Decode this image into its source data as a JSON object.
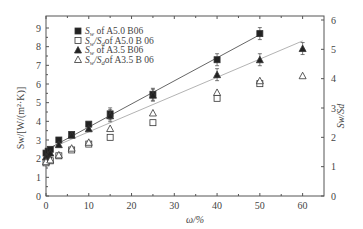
{
  "chart_data": {
    "type": "scatter",
    "title": "",
    "xlabel": "ω/%",
    "ylabel_left": "Sw/[W/(m²·K)]",
    "ylabel_right": "Sw/Sd",
    "xlim": [
      0,
      65
    ],
    "ylim_left": [
      0,
      9.5
    ],
    "ylim_right": [
      0,
      6.33
    ],
    "x_ticks": [
      0,
      10,
      20,
      30,
      40,
      50,
      60
    ],
    "y_ticks_left": [
      0,
      1,
      2,
      3,
      4,
      5,
      6,
      7,
      8,
      9
    ],
    "y_ticks_right": [
      0,
      1,
      2,
      3,
      4,
      5,
      6
    ],
    "grid": false,
    "legend_position": "upper left",
    "series": [
      {
        "name": "Sw of A5.0 B06",
        "marker": "filled-square",
        "axis": "left",
        "fit_line": true,
        "line_color": "#555555",
        "x": [
          0,
          0.5,
          1,
          3,
          6,
          10,
          15,
          25,
          40,
          50
        ],
        "values": [
          2.3,
          2.4,
          2.5,
          3.0,
          3.3,
          3.85,
          4.4,
          5.45,
          7.3,
          8.7
        ]
      },
      {
        "name": "Sw/Sd of A5.0 B 06",
        "marker": "open-square",
        "axis": "right",
        "fit_line": false,
        "x": [
          0,
          1,
          3,
          6,
          10,
          15,
          25,
          40,
          50
        ],
        "values": [
          1.13,
          1.2,
          1.37,
          1.57,
          1.77,
          2.0,
          2.5,
          3.33,
          3.83
        ]
      },
      {
        "name": "Sw of A3.5 B06",
        "marker": "filled-triangle",
        "axis": "left",
        "fit_line": true,
        "line_color": "#aaaaaa",
        "x": [
          0,
          0.5,
          1,
          3,
          6,
          10,
          15,
          25,
          40,
          50,
          60
        ],
        "values": [
          2.1,
          2.2,
          2.3,
          2.75,
          3.25,
          3.6,
          4.3,
          5.4,
          6.5,
          7.3,
          7.9
        ]
      },
      {
        "name": "Sw/Sd of A3.5 B 06",
        "marker": "open-triangle",
        "axis": "right",
        "fit_line": false,
        "x": [
          0,
          1,
          3,
          6,
          10,
          15,
          25,
          40,
          50,
          60
        ],
        "values": [
          1.17,
          1.23,
          1.4,
          1.63,
          1.83,
          2.3,
          2.83,
          3.53,
          3.93,
          4.1
        ]
      }
    ]
  },
  "legend": [
    {
      "sym": "■",
      "main": "S",
      "sub": "w",
      "rest": " of A5.0 B06"
    },
    {
      "sym": "□",
      "main": "S",
      "sub": "w",
      "mid": "/S",
      "sub2": "d",
      "rest": "of A5.0 B 06"
    },
    {
      "sym": "▲",
      "main": "S",
      "sub": "w",
      "rest": " of A3.5 B06"
    },
    {
      "sym": "△",
      "main": "S",
      "sub": "w",
      "mid": "/S",
      "sub2": "d",
      "rest": "of A3.5 B 06"
    }
  ]
}
